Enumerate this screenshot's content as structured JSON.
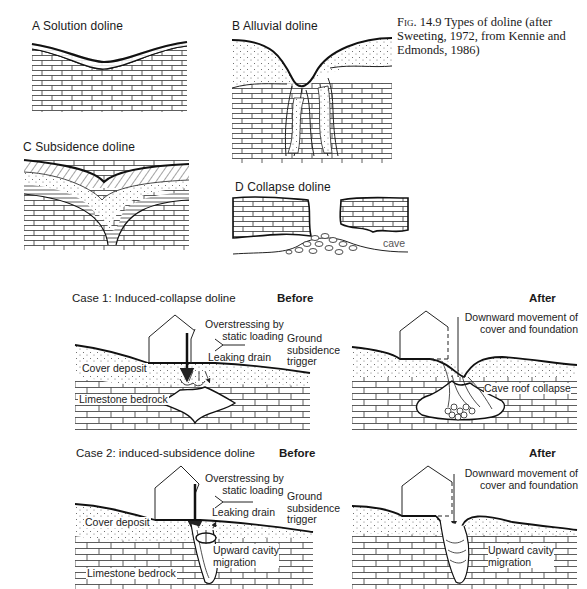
{
  "figure": {
    "number": "Fig. 14.9",
    "caption": "Types of doline (after Sweeting, 1972, from Kennie and Edmonds, 1986)"
  },
  "panels": [
    {
      "id": "A",
      "title": "A  Solution doline"
    },
    {
      "id": "B",
      "title": "B  Alluvial doline"
    },
    {
      "id": "C",
      "title": "C  Subsidence doline"
    },
    {
      "id": "D",
      "title": "D  Collapse doline",
      "labels": {
        "cave": "cave"
      }
    }
  ],
  "cases": [
    {
      "title": "Case 1: Induced-collapse doline",
      "before": {
        "heading": "Before",
        "labels": {
          "overstressing": "Overstressing by static loading",
          "overstressing_l1": "Overstressing by",
          "overstressing_l2": "static loading",
          "ground_l1": "Ground",
          "ground_l2": "subsidence",
          "ground_l3": "trigger",
          "leaking_drain": "Leaking drain",
          "cover_deposit": "Cover deposit",
          "limestone_bedrock": "Limestone bedrock"
        }
      },
      "after": {
        "heading": "After",
        "labels": {
          "downward_l1": "Downward movement of",
          "downward_l2": "cover and foundation",
          "cave_roof_collapse": "Cave roof collapse"
        }
      }
    },
    {
      "title": "Case 2: induced-subsidence doline",
      "before": {
        "heading": "Before",
        "labels": {
          "overstressing_l1": "Overstressing by",
          "overstressing_l2": "static loading",
          "ground_l1": "Ground",
          "ground_l2": "subsidence",
          "ground_l3": "trigger",
          "leaking_drain": "Leaking drain",
          "cover_deposit": "Cover deposit",
          "upward_l1": "Upward cavity",
          "upward_l2": "migration",
          "limestone_bedrock": "Limestone bedrock"
        }
      },
      "after": {
        "heading": "After",
        "labels": {
          "downward_l1": "Downward movement of",
          "downward_l2": "cover and foundation",
          "upward_l1": "Upward cavity",
          "upward_l2": "migration"
        }
      }
    }
  ]
}
